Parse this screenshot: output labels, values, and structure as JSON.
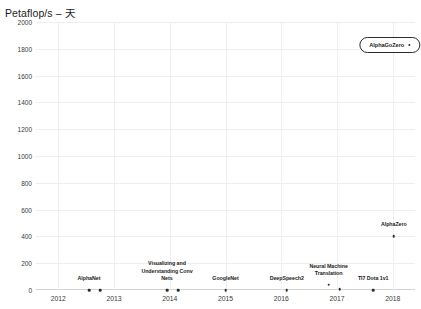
{
  "chart_data": {
    "type": "scatter",
    "title": "Petaflop/s – 天",
    "xlabel": "",
    "ylabel": "Petaflop/s – 天",
    "xlim": [
      2011.6,
      2018.4
    ],
    "ylim": [
      0,
      2000
    ],
    "grid": true,
    "legend": "none",
    "xticks": [
      "2012",
      "2013",
      "2014",
      "2015",
      "2016",
      "2017",
      "2018"
    ],
    "xtick_values": [
      2012,
      2013,
      2014,
      2015,
      2016,
      2017,
      2018
    ],
    "yticks": [
      "0",
      "200",
      "400",
      "600",
      "800",
      "1000",
      "1200",
      "1400",
      "1600",
      "1800",
      "2000"
    ],
    "ytick_values": [
      0,
      200,
      400,
      600,
      800,
      1000,
      1200,
      1400,
      1600,
      1800,
      2000
    ],
    "points": [
      {
        "label": "AlphaNet",
        "x": 2012.55,
        "y": 0,
        "label_dy": -7,
        "label_dx": 0
      },
      {
        "label": "",
        "x": 2012.75,
        "y": 0,
        "label_dy": 0,
        "label_dx": 0
      },
      {
        "label": "Visualizing and\nUnderstanding Conv\nNets",
        "x": 2013.95,
        "y": 0,
        "label_dy": -7,
        "label_dx": 0
      },
      {
        "label": "",
        "x": 2014.15,
        "y": 0,
        "label_dy": 0,
        "label_dx": 0
      },
      {
        "label": "GoogleNet",
        "x": 2015.0,
        "y": 0,
        "label_dy": -7,
        "label_dx": 0
      },
      {
        "label": "DeepSpeech2",
        "x": 2016.1,
        "y": 0,
        "label_dy": -7,
        "label_dx": 0
      },
      {
        "label": "Neural Machine\nTranslation",
        "x": 2016.85,
        "y": 40,
        "label_dy": -7,
        "label_dx": 0
      },
      {
        "label": "",
        "x": 2017.05,
        "y": 8,
        "label_dy": 0,
        "label_dx": 0
      },
      {
        "label": "TI7 Dota 1v1",
        "x": 2017.65,
        "y": 0,
        "label_dy": -7,
        "label_dx": 0
      },
      {
        "label": "AlphaZero",
        "x": 2018.02,
        "y": 400,
        "label_dy": -7,
        "label_dx": 0
      }
    ],
    "callout": {
      "label": "AlphaGoZero",
      "x": 2017.95,
      "y": 1830,
      "marker": "dot"
    },
    "colors": {
      "point": "#2b2b2b",
      "grid": "#eeeeee",
      "axis": "#d2d2d2",
      "text": "#1c1c1c",
      "background": "#ffffff"
    }
  }
}
